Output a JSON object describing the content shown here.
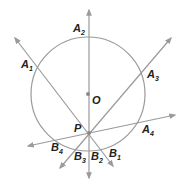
{
  "diagram": {
    "colors": {
      "line": "#9a9a9a",
      "text": "#222222",
      "point": "#8a8a8a"
    },
    "circle": {
      "cx": 88,
      "cy": 94,
      "r": 57
    },
    "center": {
      "name": "O",
      "x": 88,
      "y": 94
    },
    "point": {
      "name": "P",
      "x": 89,
      "y": 133
    },
    "lines": [
      {
        "id": "A1B1",
        "x1": 15,
        "y1": 38,
        "x2": 113,
        "y2": 166
      },
      {
        "id": "A2B2",
        "x1": 89,
        "y1": 10,
        "x2": 89,
        "y2": 178
      },
      {
        "id": "A3B3",
        "x1": 171,
        "y1": 38,
        "x2": 60,
        "y2": 168
      },
      {
        "id": "A4B4",
        "x1": 175,
        "y1": 115,
        "x2": 28,
        "y2": 146
      }
    ],
    "labels": [
      {
        "id": "A1",
        "main": "A",
        "sub": "1",
        "x": 21,
        "y": 68
      },
      {
        "id": "A2",
        "main": "A",
        "sub": "2",
        "x": 73,
        "y": 32
      },
      {
        "id": "A3",
        "main": "A",
        "sub": "3",
        "x": 147,
        "y": 78
      },
      {
        "id": "A4",
        "main": "A",
        "sub": "4",
        "x": 142,
        "y": 133
      },
      {
        "id": "O",
        "main": "O",
        "sub": "",
        "x": 92,
        "y": 104
      },
      {
        "id": "P",
        "main": "P",
        "sub": "",
        "x": 74,
        "y": 132
      },
      {
        "id": "B4",
        "main": "B",
        "sub": "4",
        "x": 51,
        "y": 151
      },
      {
        "id": "B3",
        "main": "B",
        "sub": "3",
        "x": 74,
        "y": 160
      },
      {
        "id": "B2",
        "main": "B",
        "sub": "2",
        "x": 91,
        "y": 160
      },
      {
        "id": "B1",
        "main": "B",
        "sub": "1",
        "x": 109,
        "y": 157
      }
    ]
  }
}
